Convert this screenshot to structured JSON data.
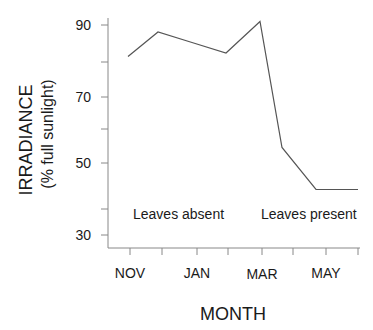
{
  "chart_data": {
    "type": "line",
    "title": "",
    "xlabel": "MONTH",
    "ylabel": "IRRADIANCE",
    "ylabel_sub": "(% full sunlight)",
    "x_tick_labels": [
      "NOV",
      "JAN",
      "MAR",
      "MAY"
    ],
    "y_ticks": [
      30,
      50,
      70,
      90
    ],
    "ylim": [
      27,
      92
    ],
    "grid": false,
    "legend": "none",
    "series": [
      {
        "name": "Irradiance",
        "x": [
          "Nov",
          "Dec",
          "Jan",
          "Feb",
          "Mar",
          "Apr",
          "May",
          "Jun"
        ],
        "values": [
          81,
          88,
          85,
          82,
          91,
          55,
          43,
          43
        ]
      }
    ],
    "annotations": [
      "Leaves absent",
      "Leaves present"
    ]
  },
  "labels": {
    "ylabel": "IRRADIANCE",
    "ylabel_sub": "(% full sunlight)",
    "xlabel": "MONTH",
    "y90": "90",
    "y70": "70",
    "y50": "50",
    "y30": "30",
    "xNov": "NOV",
    "xJan": "JAN",
    "xMar": "MAR",
    "xMay": "MAY",
    "absent": "Leaves absent",
    "present": "Leaves present"
  },
  "colors": {
    "line": "#555555",
    "axis": "#888888",
    "text": "#1a1a1a"
  }
}
